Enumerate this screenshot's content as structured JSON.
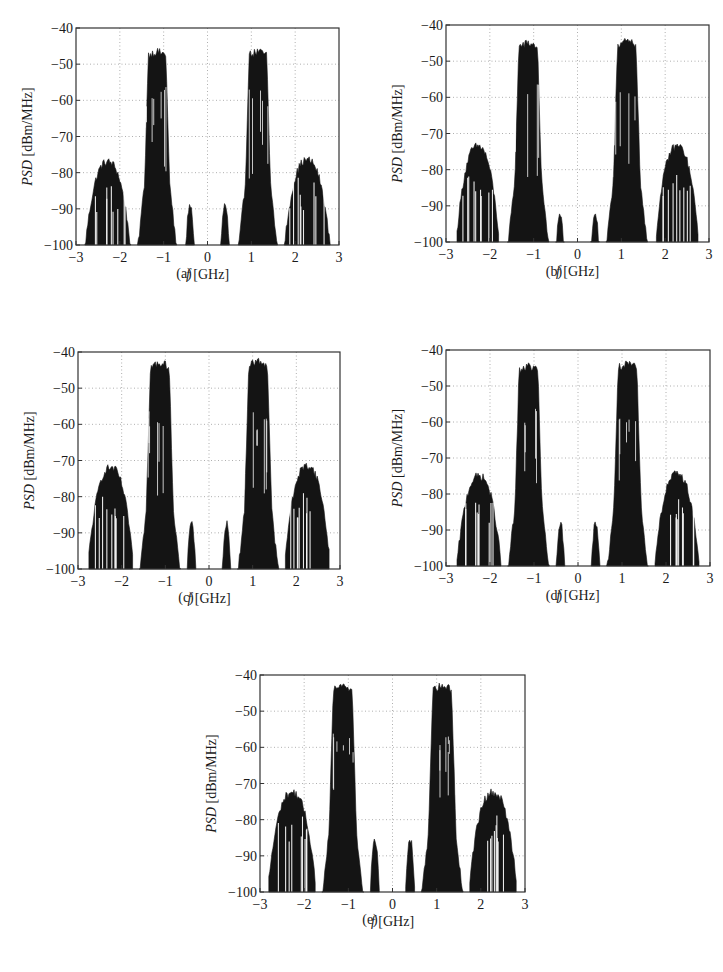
{
  "figure": {
    "xlabel_italic": "f",
    "xlabel_unit": " [GHz]",
    "ylabel_italic": "PSD",
    "ylabel_unit": " [dBm/MHz]",
    "xticks": [
      "−3",
      "−2",
      "−1",
      "0",
      "1",
      "2",
      "3"
    ],
    "yticks": [
      "−40",
      "−50",
      "−60",
      "−70",
      "−80",
      "−90",
      "−100"
    ],
    "colors": {
      "trace": "#141414",
      "grid": "#9a9a9a",
      "frame": "#333333"
    }
  },
  "panels": [
    {
      "caption": "(a)",
      "left": 76,
      "top": 28,
      "width": 263,
      "height": 217,
      "caption_x": 184,
      "caption_y": 276
    },
    {
      "caption": "(b)",
      "left": 446,
      "top": 25,
      "width": 263,
      "height": 217,
      "caption_x": 554,
      "caption_y": 274
    },
    {
      "caption": "(c)",
      "left": 78,
      "top": 352,
      "width": 262,
      "height": 217,
      "caption_x": 186,
      "caption_y": 600
    },
    {
      "caption": "(d)",
      "left": 446,
      "top": 350,
      "width": 264,
      "height": 216,
      "caption_x": 554,
      "caption_y": 598
    },
    {
      "caption": "(e)",
      "left": 260,
      "top": 675,
      "width": 265,
      "height": 217,
      "caption_x": 370,
      "caption_y": 922
    }
  ],
  "chart_data": [
    {
      "type": "area",
      "title": "(a)",
      "xlabel": "f [GHz]",
      "ylabel": "PSD [dBm/MHz]",
      "xlim": [
        -3,
        3
      ],
      "ylim": [
        -100,
        -40
      ],
      "grid": true,
      "xticks": [
        -3,
        -2,
        -1,
        0,
        1,
        2,
        3
      ],
      "yticks": [
        -100,
        -90,
        -80,
        -70,
        -60,
        -50,
        -40
      ],
      "bands": [
        {
          "name": "3rd-order IMD (lower)",
          "f_low": -2.8,
          "f_high": -1.75,
          "peak_dBm_MHz": -77,
          "floor_dips_to": -100
        },
        {
          "name": "carrier (lower)",
          "f_low": -1.6,
          "f_high": -0.7,
          "peak_dBm_MHz": -46.5,
          "core_low": -1.35,
          "core_high": -0.95,
          "min_in_band": -83
        },
        {
          "name": "inner spur (lower)",
          "f_low": -0.5,
          "f_high": -0.3,
          "peak_dBm_MHz": -89
        },
        {
          "name": "inner spur (upper)",
          "f_low": 0.3,
          "f_high": 0.5,
          "peak_dBm_MHz": -89
        },
        {
          "name": "carrier (upper)",
          "f_low": 0.7,
          "f_high": 1.6,
          "peak_dBm_MHz": -46.5,
          "core_low": 0.95,
          "core_high": 1.35,
          "min_in_band": -83
        },
        {
          "name": "3rd-order IMD (upper)",
          "f_low": 1.75,
          "f_high": 2.8,
          "peak_dBm_MHz": -76.5,
          "floor_dips_to": -100
        }
      ]
    },
    {
      "type": "area",
      "title": "(b)",
      "xlabel": "f [GHz]",
      "ylabel": "PSD [dBm/MHz]",
      "xlim": [
        -3,
        3
      ],
      "ylim": [
        -100,
        -40
      ],
      "grid": true,
      "xticks": [
        -3,
        -2,
        -1,
        0,
        1,
        2,
        3
      ],
      "yticks": [
        -100,
        -90,
        -80,
        -70,
        -60,
        -50,
        -40
      ],
      "bands": [
        {
          "name": "3rd-order IMD (lower)",
          "f_low": -2.75,
          "f_high": -1.8,
          "peak_dBm_MHz": -73.5
        },
        {
          "name": "carrier (lower)",
          "f_low": -1.6,
          "f_high": -0.65,
          "peak_dBm_MHz": -45,
          "min_in_band": -84
        },
        {
          "name": "inner spur (lower)",
          "f_low": -0.5,
          "f_high": -0.3,
          "peak_dBm_MHz": -92
        },
        {
          "name": "inner spur (upper)",
          "f_low": 0.3,
          "f_high": 0.5,
          "peak_dBm_MHz": -92
        },
        {
          "name": "carrier (upper)",
          "f_low": 0.65,
          "f_high": 1.6,
          "peak_dBm_MHz": -44.5,
          "min_in_band": -84
        },
        {
          "name": "3rd-order IMD (upper)",
          "f_low": 1.8,
          "f_high": 2.75,
          "peak_dBm_MHz": -73.5
        }
      ]
    },
    {
      "type": "area",
      "title": "(c)",
      "xlabel": "f [GHz]",
      "ylabel": "PSD [dBm/MHz]",
      "xlim": [
        -3,
        3
      ],
      "ylim": [
        -100,
        -40
      ],
      "grid": true,
      "xticks": [
        -3,
        -2,
        -1,
        0,
        1,
        2,
        3
      ],
      "yticks": [
        -100,
        -90,
        -80,
        -70,
        -60,
        -50,
        -40
      ],
      "bands": [
        {
          "name": "3rd-order IMD (lower)",
          "f_low": -2.75,
          "f_high": -1.75,
          "peak_dBm_MHz": -72
        },
        {
          "name": "carrier (lower)",
          "f_low": -1.6,
          "f_high": -0.65,
          "peak_dBm_MHz": -43,
          "min_in_band": -83
        },
        {
          "name": "inner spur (lower)",
          "f_low": -0.5,
          "f_high": -0.3,
          "peak_dBm_MHz": -87.5
        },
        {
          "name": "inner spur (upper)",
          "f_low": 0.3,
          "f_high": 0.5,
          "peak_dBm_MHz": -87.5
        },
        {
          "name": "carrier (upper)",
          "f_low": 0.65,
          "f_high": 1.6,
          "peak_dBm_MHz": -42.5,
          "min_in_band": -83
        },
        {
          "name": "3rd-order IMD (upper)",
          "f_low": 1.75,
          "f_high": 2.75,
          "peak_dBm_MHz": -71.5
        }
      ]
    },
    {
      "type": "area",
      "title": "(d)",
      "xlabel": "f [GHz]",
      "ylabel": "PSD [dBm/MHz]",
      "xlim": [
        -3,
        3
      ],
      "ylim": [
        -100,
        -40
      ],
      "grid": true,
      "xticks": [
        -3,
        -2,
        -1,
        0,
        1,
        2,
        3
      ],
      "yticks": [
        -100,
        -90,
        -80,
        -70,
        -60,
        -50,
        -40
      ],
      "bands": [
        {
          "name": "3rd-order IMD (lower)",
          "f_low": -2.75,
          "f_high": -1.75,
          "peak_dBm_MHz": -75
        },
        {
          "name": "carrier (lower)",
          "f_low": -1.6,
          "f_high": -0.65,
          "peak_dBm_MHz": -44.5,
          "min_in_band": -77
        },
        {
          "name": "inner spur (lower)",
          "f_low": -0.5,
          "f_high": -0.3,
          "peak_dBm_MHz": -88
        },
        {
          "name": "inner spur (upper)",
          "f_low": 0.3,
          "f_high": 0.5,
          "peak_dBm_MHz": -88
        },
        {
          "name": "carrier (upper)",
          "f_low": 0.65,
          "f_high": 1.6,
          "peak_dBm_MHz": -44,
          "min_in_band": -77
        },
        {
          "name": "3rd-order IMD (upper)",
          "f_low": 1.75,
          "f_high": 2.75,
          "peak_dBm_MHz": -74.5
        }
      ]
    },
    {
      "type": "area",
      "title": "(e)",
      "xlabel": "f [GHz]",
      "ylabel": "PSD [dBm/MHz]",
      "xlim": [
        -3,
        3
      ],
      "ylim": [
        -100,
        -40
      ],
      "grid": true,
      "xticks": [
        -3,
        -2,
        -1,
        0,
        1,
        2,
        3
      ],
      "yticks": [
        -100,
        -90,
        -80,
        -70,
        -60,
        -50,
        -40
      ],
      "bands": [
        {
          "name": "3rd-order IMD (lower)",
          "f_low": -2.8,
          "f_high": -1.75,
          "peak_dBm_MHz": -72.5
        },
        {
          "name": "carrier (lower)",
          "f_low": -1.6,
          "f_high": -0.65,
          "peak_dBm_MHz": -43,
          "min_in_band": -74
        },
        {
          "name": "inner spur (lower)",
          "f_low": -0.5,
          "f_high": -0.3,
          "peak_dBm_MHz": -85.5
        },
        {
          "name": "inner spur (upper)",
          "f_low": 0.3,
          "f_high": 0.5,
          "peak_dBm_MHz": -85.5
        },
        {
          "name": "carrier (upper)",
          "f_low": 0.65,
          "f_high": 1.6,
          "peak_dBm_MHz": -43,
          "min_in_band": -74
        },
        {
          "name": "3rd-order IMD (upper)",
          "f_low": 1.75,
          "f_high": 2.8,
          "peak_dBm_MHz": -72.5
        }
      ]
    }
  ]
}
